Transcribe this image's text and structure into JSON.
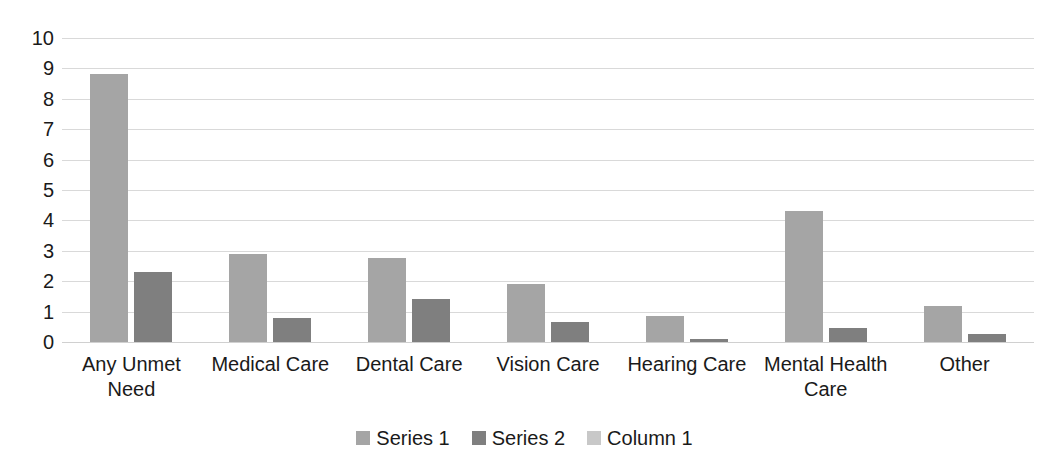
{
  "chart_data": {
    "type": "bar",
    "title": "",
    "subtitle": "",
    "xlabel": "",
    "ylabel": "",
    "ylim": [
      0,
      10
    ],
    "ytick_step": 1,
    "yticks": [
      "10",
      "9",
      "8",
      "7",
      "6",
      "5",
      "4",
      "3",
      "2",
      "1",
      "0"
    ],
    "grid": true,
    "legend_position": "bottom",
    "categories": [
      "Any Unmet Need",
      "Medical Care",
      "Dental Care",
      "Vision Care",
      "Hearing Care",
      "Mental Health Care",
      "Other"
    ],
    "series": [
      {
        "name": "Series 1",
        "color": "#a5a5a5",
        "values": [
          8.8,
          2.9,
          2.75,
          1.9,
          0.85,
          4.3,
          1.2
        ]
      },
      {
        "name": "Series 2",
        "color": "#7f7f7f",
        "values": [
          2.3,
          0.8,
          1.42,
          0.65,
          0.1,
          0.45,
          0.27
        ]
      },
      {
        "name": "Column 1",
        "color": "#c8c8c8",
        "values": [
          0,
          0,
          0,
          0,
          0,
          0,
          0
        ]
      }
    ]
  },
  "colors": {
    "background": "#ffffff",
    "gridline": "#d9d9d9",
    "text": "#1a1a1a",
    "series_1": "#a5a5a5",
    "series_2": "#7f7f7f",
    "column_1": "#c8c8c8"
  }
}
